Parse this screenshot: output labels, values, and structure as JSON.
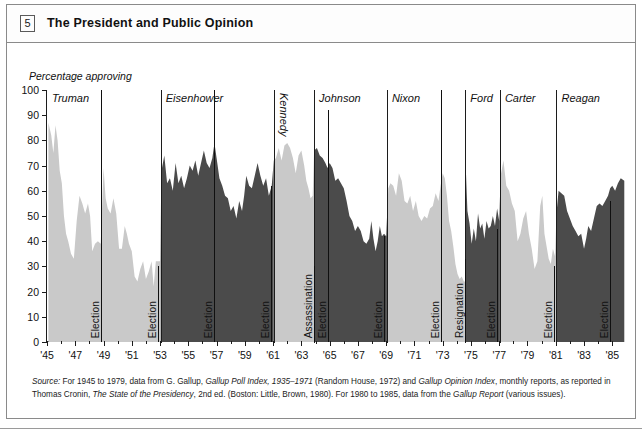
{
  "header": {
    "box_number": "5",
    "title": "The President and Public Opinion"
  },
  "chart_data": {
    "type": "area",
    "title": "The President and Public Opinion",
    "ylabel": "Percentage approving",
    "xlabel": "",
    "ylim": [
      0,
      100
    ],
    "ytick_labels": [
      "0",
      "10",
      "20",
      "30",
      "40",
      "50",
      "60",
      "70",
      "80",
      "90",
      "100"
    ],
    "ytick_values": [
      0,
      10,
      20,
      30,
      40,
      50,
      60,
      70,
      80,
      90,
      100
    ],
    "xlim": [
      1945,
      1985.9
    ],
    "xtick_labels": [
      "'45",
      "'47",
      "'49",
      "'51",
      "'53",
      "'55",
      "'57",
      "'59",
      "'61",
      "'63",
      "'65",
      "'67",
      "'69",
      "'71",
      "'73",
      "'75",
      "'77",
      "'79",
      "'81",
      "'83",
      "'85"
    ],
    "xtick_values": [
      1945,
      1947,
      1949,
      1951,
      1953,
      1955,
      1957,
      1959,
      1961,
      1963,
      1965,
      1967,
      1969,
      1971,
      1973,
      1975,
      1977,
      1979,
      1981,
      1983,
      1985
    ],
    "grid": false,
    "legend": "none",
    "colors": {
      "light_fill": "#c9c9c9",
      "dark_fill": "#4b4b4b",
      "axis": "#1c1c1c",
      "background": "#ffffff"
    },
    "panels": [
      {
        "name": "Truman",
        "start": 1945.0,
        "end": 1953.05,
        "fill": "light",
        "label_orientation": "horizontal"
      },
      {
        "name": "Eisenhower",
        "start": 1953.05,
        "end": 1961.05,
        "fill": "dark",
        "label_orientation": "horizontal"
      },
      {
        "name": "Kennedy",
        "start": 1961.05,
        "end": 1963.9,
        "fill": "light",
        "label_orientation": "vertical"
      },
      {
        "name": "Johnson",
        "start": 1963.9,
        "end": 1969.05,
        "fill": "dark",
        "label_orientation": "horizontal"
      },
      {
        "name": "Nixon",
        "start": 1969.05,
        "end": 1974.6,
        "fill": "light",
        "label_orientation": "horizontal"
      },
      {
        "name": "Ford",
        "start": 1974.6,
        "end": 1977.05,
        "fill": "dark",
        "label_orientation": "horizontal"
      },
      {
        "name": "Carter",
        "start": 1977.05,
        "end": 1981.05,
        "fill": "light",
        "label_orientation": "horizontal"
      },
      {
        "name": "Reagan",
        "start": 1981.05,
        "end": 1985.9,
        "fill": "dark",
        "label_orientation": "horizontal"
      }
    ],
    "events": [
      {
        "label": "Election",
        "year": 1948.85,
        "top_value": 100
      },
      {
        "label": "Election",
        "year": 1952.85,
        "top_value": 30
      },
      {
        "label": "Election",
        "year": 1956.85,
        "top_value": 100
      },
      {
        "label": "Election",
        "year": 1960.85,
        "top_value": 62
      },
      {
        "label": "Assassination",
        "year": 1963.88,
        "top_value": 30
      },
      {
        "label": "Election",
        "year": 1964.85,
        "top_value": 92
      },
      {
        "label": "Election",
        "year": 1968.85,
        "top_value": 42
      },
      {
        "label": "Election",
        "year": 1972.85,
        "top_value": 100
      },
      {
        "label": "Resignation",
        "year": 1974.6,
        "top_value": 33
      },
      {
        "label": "Election",
        "year": 1976.85,
        "top_value": 45
      },
      {
        "label": "Election",
        "year": 1980.85,
        "top_value": 30
      },
      {
        "label": "Election",
        "year": 1984.85,
        "top_value": 56
      }
    ],
    "series": [
      {
        "name": "Presidential approval (Gallup)",
        "points": [
          [
            1945.1,
            87
          ],
          [
            1945.3,
            82
          ],
          [
            1945.45,
            75
          ],
          [
            1945.6,
            86
          ],
          [
            1945.75,
            80
          ],
          [
            1945.9,
            68
          ],
          [
            1946.05,
            63
          ],
          [
            1946.2,
            50
          ],
          [
            1946.35,
            43
          ],
          [
            1946.5,
            40
          ],
          [
            1946.7,
            35
          ],
          [
            1946.9,
            33
          ],
          [
            1947.1,
            48
          ],
          [
            1947.3,
            58
          ],
          [
            1947.5,
            55
          ],
          [
            1947.7,
            51
          ],
          [
            1947.9,
            55
          ],
          [
            1948.05,
            50
          ],
          [
            1948.2,
            36
          ],
          [
            1948.4,
            39
          ],
          [
            1948.6,
            40
          ],
          [
            1948.8,
            39
          ],
          [
            1949.0,
            69
          ],
          [
            1949.15,
            57
          ],
          [
            1949.3,
            53
          ],
          [
            1949.5,
            51
          ],
          [
            1949.7,
            57
          ],
          [
            1949.9,
            51
          ],
          [
            1950.1,
            37
          ],
          [
            1950.3,
            37
          ],
          [
            1950.5,
            46
          ],
          [
            1950.65,
            43
          ],
          [
            1950.8,
            39
          ],
          [
            1951.0,
            36
          ],
          [
            1951.2,
            26
          ],
          [
            1951.4,
            24
          ],
          [
            1951.6,
            29
          ],
          [
            1951.8,
            32
          ],
          [
            1952.0,
            25
          ],
          [
            1952.2,
            28
          ],
          [
            1952.4,
            32
          ],
          [
            1952.55,
            22
          ],
          [
            1952.7,
            32
          ],
          [
            1952.85,
            32
          ],
          [
            1953.0,
            32
          ],
          [
            1953.1,
            68
          ],
          [
            1953.3,
            74
          ],
          [
            1953.5,
            63
          ],
          [
            1953.7,
            65
          ],
          [
            1953.9,
            60
          ],
          [
            1954.1,
            71
          ],
          [
            1954.3,
            63
          ],
          [
            1954.5,
            66
          ],
          [
            1954.7,
            61
          ],
          [
            1954.9,
            65
          ],
          [
            1955.1,
            70
          ],
          [
            1955.3,
            68
          ],
          [
            1955.5,
            72
          ],
          [
            1955.7,
            66
          ],
          [
            1955.9,
            71
          ],
          [
            1956.1,
            76
          ],
          [
            1956.3,
            71
          ],
          [
            1956.5,
            69
          ],
          [
            1956.7,
            73
          ],
          [
            1956.85,
            79
          ],
          [
            1957.0,
            73
          ],
          [
            1957.2,
            65
          ],
          [
            1957.4,
            62
          ],
          [
            1957.6,
            58
          ],
          [
            1957.8,
            57
          ],
          [
            1958.0,
            52
          ],
          [
            1958.2,
            54
          ],
          [
            1958.4,
            49
          ],
          [
            1958.6,
            56
          ],
          [
            1958.8,
            52
          ],
          [
            1958.95,
            58
          ],
          [
            1959.1,
            66
          ],
          [
            1959.3,
            62
          ],
          [
            1959.5,
            61
          ],
          [
            1959.7,
            66
          ],
          [
            1959.9,
            71
          ],
          [
            1960.1,
            66
          ],
          [
            1960.3,
            62
          ],
          [
            1960.5,
            65
          ],
          [
            1960.7,
            58
          ],
          [
            1960.9,
            62
          ],
          [
            1961.05,
            72
          ],
          [
            1961.2,
            73
          ],
          [
            1961.4,
            77
          ],
          [
            1961.6,
            72
          ],
          [
            1961.8,
            78
          ],
          [
            1962.0,
            79
          ],
          [
            1962.2,
            77
          ],
          [
            1962.4,
            73
          ],
          [
            1962.6,
            67
          ],
          [
            1962.8,
            74
          ],
          [
            1963.0,
            76
          ],
          [
            1963.2,
            70
          ],
          [
            1963.35,
            64
          ],
          [
            1963.5,
            61
          ],
          [
            1963.65,
            57
          ],
          [
            1963.8,
            58
          ],
          [
            1963.9,
            76
          ],
          [
            1964.1,
            77
          ],
          [
            1964.3,
            74
          ],
          [
            1964.5,
            73
          ],
          [
            1964.7,
            71
          ],
          [
            1964.85,
            69
          ],
          [
            1965.0,
            71
          ],
          [
            1965.2,
            69
          ],
          [
            1965.4,
            64
          ],
          [
            1965.6,
            65
          ],
          [
            1965.8,
            63
          ],
          [
            1966.0,
            61
          ],
          [
            1966.2,
            56
          ],
          [
            1966.4,
            50
          ],
          [
            1966.6,
            48
          ],
          [
            1966.8,
            44
          ],
          [
            1967.0,
            46
          ],
          [
            1967.2,
            44
          ],
          [
            1967.4,
            40
          ],
          [
            1967.6,
            39
          ],
          [
            1967.8,
            41
          ],
          [
            1967.95,
            48
          ],
          [
            1968.1,
            41
          ],
          [
            1968.25,
            36
          ],
          [
            1968.4,
            40
          ],
          [
            1968.55,
            46
          ],
          [
            1968.7,
            42
          ],
          [
            1968.85,
            43
          ],
          [
            1969.0,
            42
          ],
          [
            1969.15,
            61
          ],
          [
            1969.3,
            63
          ],
          [
            1969.5,
            62
          ],
          [
            1969.7,
            58
          ],
          [
            1969.9,
            67
          ],
          [
            1970.1,
            64
          ],
          [
            1970.3,
            56
          ],
          [
            1970.5,
            55
          ],
          [
            1970.7,
            58
          ],
          [
            1970.9,
            52
          ],
          [
            1971.1,
            56
          ],
          [
            1971.3,
            50
          ],
          [
            1971.5,
            48
          ],
          [
            1971.7,
            50
          ],
          [
            1971.9,
            49
          ],
          [
            1972.1,
            53
          ],
          [
            1972.3,
            54
          ],
          [
            1972.5,
            59
          ],
          [
            1972.7,
            56
          ],
          [
            1972.85,
            62
          ],
          [
            1973.0,
            67
          ],
          [
            1973.15,
            65
          ],
          [
            1973.3,
            58
          ],
          [
            1973.45,
            48
          ],
          [
            1973.6,
            44
          ],
          [
            1973.75,
            38
          ],
          [
            1973.9,
            31
          ],
          [
            1974.05,
            27
          ],
          [
            1974.2,
            25
          ],
          [
            1974.35,
            26
          ],
          [
            1974.5,
            24
          ],
          [
            1974.6,
            24
          ],
          [
            1974.62,
            71
          ],
          [
            1974.75,
            52
          ],
          [
            1974.9,
            47
          ],
          [
            1975.05,
            39
          ],
          [
            1975.2,
            45
          ],
          [
            1975.35,
            40
          ],
          [
            1975.5,
            51
          ],
          [
            1975.65,
            45
          ],
          [
            1975.8,
            47
          ],
          [
            1975.95,
            41
          ],
          [
            1976.1,
            48
          ],
          [
            1976.25,
            45
          ],
          [
            1976.4,
            46
          ],
          [
            1976.55,
            50
          ],
          [
            1976.7,
            46
          ],
          [
            1976.85,
            53
          ],
          [
            1977.0,
            48
          ],
          [
            1977.1,
            66
          ],
          [
            1977.3,
            72
          ],
          [
            1977.5,
            62
          ],
          [
            1977.7,
            60
          ],
          [
            1977.9,
            55
          ],
          [
            1978.1,
            52
          ],
          [
            1978.3,
            40
          ],
          [
            1978.5,
            43
          ],
          [
            1978.7,
            49
          ],
          [
            1978.9,
            52
          ],
          [
            1979.1,
            43
          ],
          [
            1979.3,
            37
          ],
          [
            1979.5,
            29
          ],
          [
            1979.7,
            32
          ],
          [
            1979.9,
            54
          ],
          [
            1980.05,
            58
          ],
          [
            1980.2,
            43
          ],
          [
            1980.35,
            38
          ],
          [
            1980.5,
            33
          ],
          [
            1980.65,
            31
          ],
          [
            1980.8,
            37
          ],
          [
            1980.95,
            34
          ],
          [
            1981.05,
            51
          ],
          [
            1981.2,
            60
          ],
          [
            1981.4,
            59
          ],
          [
            1981.6,
            58
          ],
          [
            1981.8,
            52
          ],
          [
            1982.0,
            49
          ],
          [
            1982.2,
            46
          ],
          [
            1982.4,
            44
          ],
          [
            1982.6,
            42
          ],
          [
            1982.8,
            43
          ],
          [
            1983.0,
            37
          ],
          [
            1983.15,
            41
          ],
          [
            1983.3,
            46
          ],
          [
            1983.5,
            44
          ],
          [
            1983.7,
            49
          ],
          [
            1983.9,
            54
          ],
          [
            1984.1,
            55
          ],
          [
            1984.3,
            54
          ],
          [
            1984.5,
            56
          ],
          [
            1984.7,
            58
          ],
          [
            1984.85,
            61
          ],
          [
            1985.0,
            62
          ],
          [
            1985.2,
            60
          ],
          [
            1985.4,
            63
          ],
          [
            1985.6,
            65
          ],
          [
            1985.85,
            64
          ]
        ]
      }
    ]
  },
  "source_note": {
    "prefix": "Source:",
    "line1_a": " For 1945 to 1979, data from G. Gallup, ",
    "italic1": "Gallup Poll Index, 1935–1971",
    "line1_b": " (Random House, 1972) and ",
    "italic2": "Gallup Opinion Index",
    "line1_c": ", monthly reports, as",
    "line2_a": "reported in Thomas Cronin, ",
    "italic3": "The State of the Presidency",
    "line2_b": ", 2nd ed. (Boston: Little, Brown, 1980). For 1980 to 1985, data from the ",
    "italic4": "Gallup Report",
    "line2_c": " (various issues)."
  }
}
